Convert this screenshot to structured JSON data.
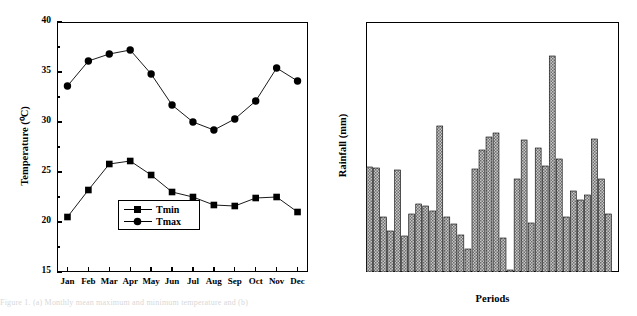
{
  "figure": {
    "caption_fragment": "Figure 1. (a) Monthly mean maximum and minimum temperature and (b)"
  },
  "chart_data": [
    {
      "id": "panel-a",
      "type": "line",
      "panel_tag": "(a)",
      "title": "",
      "xlabel": "",
      "ylabel": "Temperature (⁰C)",
      "categories": [
        "Jan",
        "Feb",
        "Mar",
        "Apr",
        "May",
        "Jun",
        "Jul",
        "Aug",
        "Sep",
        "Oct",
        "Nov",
        "Dec"
      ],
      "ylim": [
        15,
        40
      ],
      "yticks": [
        15,
        20,
        25,
        30,
        35,
        40
      ],
      "ytick_labels": [
        "15",
        "20",
        "25",
        "30",
        "35",
        "40"
      ],
      "grid": false,
      "legend_position": "lower-left-inside",
      "series": [
        {
          "name": "Tmin",
          "marker": "square",
          "values": [
            20.5,
            23.2,
            25.8,
            26.1,
            24.7,
            23.0,
            22.5,
            21.7,
            21.6,
            22.4,
            22.5,
            21.0
          ]
        },
        {
          "name": "Tmax",
          "marker": "circle",
          "values": [
            33.6,
            36.1,
            36.8,
            37.2,
            34.8,
            31.7,
            30.0,
            29.2,
            30.3,
            32.1,
            35.4,
            34.1
          ]
        }
      ]
    },
    {
      "id": "panel-b",
      "type": "bar",
      "panel_tag": "(b)",
      "title": "",
      "xlabel": "Periods",
      "ylabel": "Rainfall (mm)",
      "ylim": [
        0,
        250
      ],
      "yticks": [
        0,
        50,
        100,
        150,
        200,
        250
      ],
      "ytick_labels": [
        "0",
        "50",
        "100",
        "150",
        "200",
        "250"
      ],
      "xtick_labels": [
        "1984/85",
        "1989/90",
        "1994/95",
        "1999/00",
        "2004/05",
        "2009/10",
        "2014/15"
      ],
      "xtick_indices": [
        3,
        8,
        13,
        18,
        23,
        28,
        33
      ],
      "grid": false,
      "bar_fill": "#9a9a9a",
      "bar_edge": "#000000",
      "categories": [
        "1981/82",
        "1982/83",
        "1983/84",
        "1984/85",
        "1985/86",
        "1986/87",
        "1987/88",
        "1988/89",
        "1989/90",
        "1990/91",
        "1991/92",
        "1992/93",
        "1993/94",
        "1994/95",
        "1995/96",
        "1996/97",
        "1997/98",
        "1998/99",
        "1999/00",
        "2000/01",
        "2001/02",
        "2002/03",
        "2003/04",
        "2004/05",
        "2005/06",
        "2006/07",
        "2007/08",
        "2008/09",
        "2009/10",
        "2010/11",
        "2011/12",
        "2012/13",
        "2013/14",
        "2014/15",
        "2015/16"
      ],
      "values": [
        105,
        104,
        55,
        41,
        102,
        36,
        58,
        68,
        66,
        61,
        146,
        55,
        48,
        37,
        23,
        103,
        122,
        135,
        139,
        34,
        2,
        93,
        132,
        49,
        124,
        106,
        216,
        113,
        55,
        81,
        72,
        77,
        133,
        93,
        58,
        94
      ]
    }
  ]
}
